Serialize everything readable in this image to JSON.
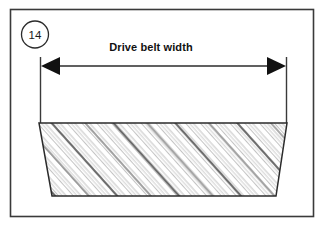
{
  "figure": {
    "number_label": "14",
    "caption": "Drive belt width",
    "background_color": "#ffffff",
    "border_color": "#3a3a3a",
    "line_color": "#2b2b2b",
    "hatch_color": "#8a8a8a",
    "hatch_accent_color": "#555555"
  },
  "dimension": {
    "label": "Drive belt width",
    "left_arrow_icon": "arrow-left-solid",
    "right_arrow_icon": "arrow-right-solid",
    "line_y": 66,
    "left_x": 40,
    "right_x": 287
  },
  "belt": {
    "shape": "trapezoid",
    "top_left_x": 39,
    "top_right_x": 287,
    "bottom_left_x": 52,
    "bottom_right_x": 276,
    "top_y": 123,
    "bottom_y": 196,
    "fill_pattern": "diagonal-hatch"
  }
}
